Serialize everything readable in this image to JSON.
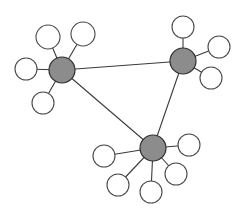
{
  "diagram": {
    "type": "network-graph",
    "colors": {
      "background": "#ffffff",
      "hub_fill": "#8c8c8c",
      "hub_stroke": "#2e2e2e",
      "leaf_fill": "#ffffff",
      "leaf_stroke": "#4a4a4a",
      "edge": "#3a3a3a"
    },
    "hubs": [
      {
        "id": "hub-a",
        "cx": 62,
        "cy": 70,
        "r": 13
      },
      {
        "id": "hub-b",
        "cx": 183,
        "cy": 61,
        "r": 13
      },
      {
        "id": "hub-c",
        "cx": 153,
        "cy": 148,
        "r": 13
      }
    ],
    "hub_edges": [
      {
        "from": "hub-a",
        "to": "hub-b"
      },
      {
        "from": "hub-b",
        "to": "hub-c"
      },
      {
        "from": "hub-a",
        "to": "hub-c"
      }
    ],
    "leaves": [
      {
        "hub": "hub-a",
        "cx": 48,
        "cy": 37,
        "r": 12
      },
      {
        "hub": "hub-a",
        "cx": 83,
        "cy": 34,
        "r": 12
      },
      {
        "hub": "hub-a",
        "cx": 26,
        "cy": 69,
        "r": 11
      },
      {
        "hub": "hub-a",
        "cx": 43,
        "cy": 103,
        "r": 11
      },
      {
        "hub": "hub-b",
        "cx": 183,
        "cy": 27,
        "r": 11
      },
      {
        "hub": "hub-b",
        "cx": 219,
        "cy": 47,
        "r": 11
      },
      {
        "hub": "hub-b",
        "cx": 211,
        "cy": 78,
        "r": 11
      },
      {
        "hub": "hub-c",
        "cx": 104,
        "cy": 156,
        "r": 11
      },
      {
        "hub": "hub-c",
        "cx": 189,
        "cy": 145,
        "r": 11
      },
      {
        "hub": "hub-c",
        "cx": 118,
        "cy": 185,
        "r": 11
      },
      {
        "hub": "hub-c",
        "cx": 151,
        "cy": 192,
        "r": 11
      },
      {
        "hub": "hub-c",
        "cx": 176,
        "cy": 174,
        "r": 11
      }
    ]
  }
}
